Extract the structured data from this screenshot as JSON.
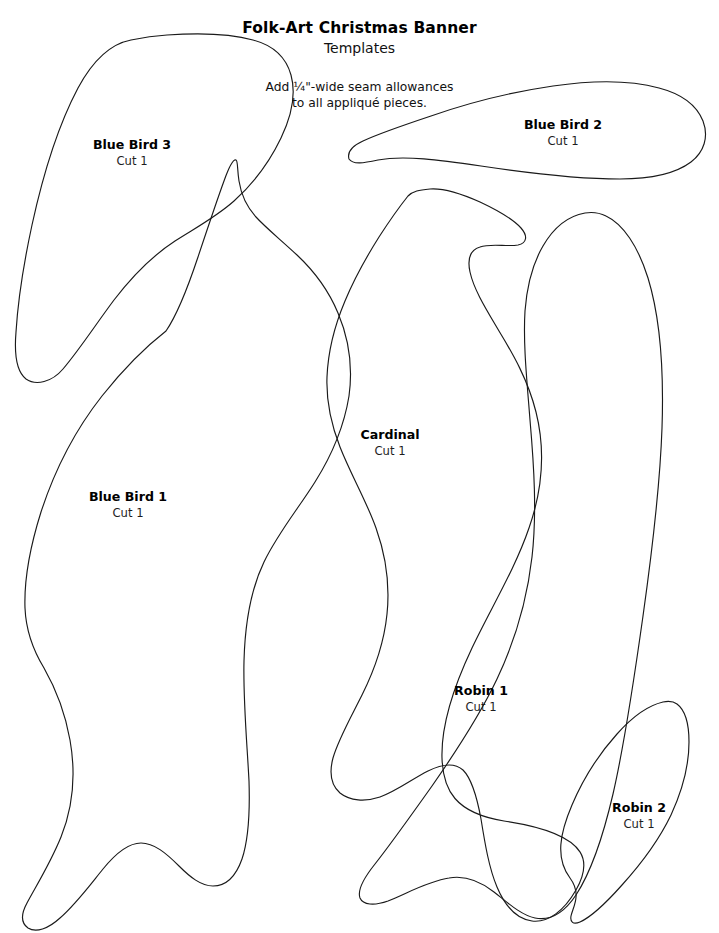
{
  "document": {
    "title": "Folk-Art Christmas Banner",
    "subtitle": "Templates",
    "note_line_1": "Add ¼\"-wide seam allowances",
    "note_line_2": "to all appliqué pieces.",
    "background_color": "#ffffff",
    "outline_color": "#1a1a1a",
    "text_color": "#000000"
  },
  "pieces": [
    {
      "id": "blue-bird-3",
      "name": "Blue Bird 3",
      "cut": "Cut 1",
      "label_x": 132,
      "label_y": 138,
      "outline": "M 131 40 C 110 44 92 62 78 88 C 60 122 44 170 32 225 C 24 262 18 300 16 332 C 14 356 17 372 26 379 C 36 386 52 382 63 369 C 80 349 96 324 114 300 C 134 274 155 254 175 241 C 197 227 216 217 234 201 C 254 183 270 161 281 138 C 292 115 296 93 291 75 C 286 57 272 45 253 40 C 228 33 196 33 167 35 C 153 36 141 38 131 40 Z"
    },
    {
      "id": "blue-bird-2",
      "name": "Blue Bird 2",
      "cut": "Cut 1",
      "label_x": 563,
      "label_y": 118,
      "outline": "M 349 159 C 347 152 352 146 363 141 C 380 133 404 125 431 116 C 468 103 512 92 553 86 C 594 80 630 80 659 88 C 682 94 697 106 703 121 C 709 137 704 152 691 162 C 675 174 650 179 620 179 C 578 179 528 173 481 166 C 440 160 404 155 378 160 C 364 163 353 165 349 159 Z"
    },
    {
      "id": "blue-bird-1",
      "name": "Blue Bird 1",
      "cut": "Cut 1",
      "label_x": 128,
      "label_y": 490,
      "outline": "M 166 331 C 148 345 125 367 102 396 C 76 429 55 469 41 512 C 30 547 24 580 25 608 C 26 632 33 650 44 668 C 56 689 65 712 70 740 C 76 774 73 807 61 837 C 50 864 36 886 27 903 C 21 914 21 923 28 928 C 36 933 48 929 60 918 C 76 904 90 885 103 869 C 116 853 128 843 141 843 C 154 843 166 853 179 866 C 190 877 201 886 213 886 C 226 886 236 876 242 859 C 249 838 250 811 249 781 C 247 742 243 700 244 661 C 245 622 251 589 264 562 C 278 533 298 509 315 482 C 332 455 344 427 349 396 C 353 367 349 339 338 313 C 328 289 313 270 297 255 C 281 240 266 228 256 217 C 246 206 241 194 239 181 C 237 168 238 161 236 160 C 233 159 229 167 224 181 C 217 200 208 227 198 257 C 188 287 177 315 166 331 Z"
    },
    {
      "id": "cardinal",
      "name": "Cardinal",
      "cut": "Cut 1",
      "label_x": 390,
      "label_y": 428,
      "outline": "M 408 196 C 400 206 390 220 379 237 C 367 256 355 277 345 301 C 334 327 328 352 327 377 C 326 402 331 424 340 447 C 351 475 366 500 376 528 C 386 556 390 585 387 614 C 384 644 374 671 362 695 C 350 719 338 740 333 758 C 329 773 331 785 340 793 C 350 801 365 802 380 797 C 397 791 412 779 428 771 C 442 764 454 762 463 770 C 472 779 477 797 481 819 C 485 844 489 868 497 887 C 505 906 517 919 532 921 C 548 923 564 911 576 890 C 589 867 598 835 504 821 C 455 813 443 790 442 758 C 441 725 454 686 472 648 C 491 608 515 569 529 528 C 543 488 545 448 536 412 C 528 380 513 354 499 331 C 486 309 474 290 470 272 C 467 258 470 250 480 247 C 491 243 507 247 518 245 C 527 243 528 236 521 228 C 513 219 497 210 480 202 C 462 194 443 188 430 189 C 419 190 413 191 408 196 Z"
    },
    {
      "id": "robin-1",
      "name": "Robin 1",
      "cut": "Cut 1",
      "label_x": 481,
      "label_y": 684,
      "outline": "M 585 213 C 568 216 554 227 543 246 C 533 263 527 285 525 311 C 523 344 527 381 530 420 C 534 466 537 513 532 557 C 527 601 515 641 497 679 C 479 717 455 753 432 786 C 410 817 390 845 375 864 C 363 879 357 890 360 898 C 363 905 374 906 388 901 C 406 894 428 881 449 878 C 466 875 480 881 494 892 C 508 903 521 915 535 918 C 550 921 564 913 576 895 C 591 872 603 837 613 794 C 625 742 634 680 643 616 C 652 552 660 487 662 428 C 664 369 660 317 648 278 C 638 246 623 224 606 216 C 598 212 591 212 585 213 Z"
    },
    {
      "id": "robin-2",
      "name": "Robin 2",
      "cut": "Cut 1",
      "label_x": 639,
      "label_y": 801,
      "outline": "M 663 702 C 650 705 633 716 617 734 C 599 754 583 779 572 805 C 560 833 555 858 570 878 C 582 894 573 907 571 916 C 570 922 573 925 580 922 C 591 917 606 903 622 885 C 641 864 659 840 671 815 C 683 789 689 764 689 742 C 689 723 685 710 677 704 C 673 701 668 701 663 702 Z"
    }
  ]
}
